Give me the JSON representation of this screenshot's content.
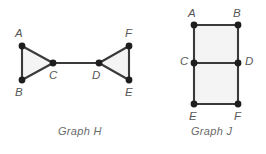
{
  "figure": {
    "width": 266,
    "height": 154,
    "background_color": "#ffffff",
    "edge_color": "#3a3a3a",
    "vertex_color": "#1e1e1e",
    "face_fill_color": "#f4f4f4",
    "label_color": "#585858",
    "caption_color": "#6a6a6a"
  },
  "graphs": [
    {
      "id": "graph-h",
      "caption": "Graph H",
      "caption_x": 58,
      "caption_y": 126,
      "vertices": [
        {
          "id": "A",
          "label": "A",
          "x": 22,
          "y": 46,
          "label_x": 15,
          "label_y": 28
        },
        {
          "id": "B",
          "label": "B",
          "x": 22,
          "y": 80,
          "label_x": 15,
          "label_y": 87
        },
        {
          "id": "C",
          "label": "C",
          "x": 53,
          "y": 63,
          "label_x": 49,
          "label_y": 70
        },
        {
          "id": "D",
          "label": "D",
          "x": 99,
          "y": 63,
          "label_x": 92,
          "label_y": 70
        },
        {
          "id": "E",
          "label": "E",
          "x": 129,
          "y": 80,
          "label_x": 125,
          "label_y": 87
        },
        {
          "id": "F",
          "label": "F",
          "x": 129,
          "y": 46,
          "label_x": 125,
          "label_y": 28
        }
      ],
      "faces": [
        {
          "id": "face-abc",
          "points": "22,46 22,80 53,63"
        },
        {
          "id": "face-def",
          "points": "99,63 129,46 129,80"
        }
      ],
      "edges": [
        {
          "id": "edge-A-B",
          "from": "A",
          "to": "B",
          "x1": 22,
          "y1": 46,
          "x2": 22,
          "y2": 80
        },
        {
          "id": "edge-A-C",
          "from": "A",
          "to": "C",
          "x1": 22,
          "y1": 46,
          "x2": 53,
          "y2": 63
        },
        {
          "id": "edge-B-C",
          "from": "B",
          "to": "C",
          "x1": 22,
          "y1": 80,
          "x2": 53,
          "y2": 63
        },
        {
          "id": "edge-C-D",
          "from": "C",
          "to": "D",
          "x1": 53,
          "y1": 63,
          "x2": 99,
          "y2": 63
        },
        {
          "id": "edge-D-F",
          "from": "D",
          "to": "F",
          "x1": 99,
          "y1": 63,
          "x2": 129,
          "y2": 46
        },
        {
          "id": "edge-D-E",
          "from": "D",
          "to": "E",
          "x1": 99,
          "y1": 63,
          "x2": 129,
          "y2": 80
        },
        {
          "id": "edge-E-F",
          "from": "E",
          "to": "F",
          "x1": 129,
          "y1": 80,
          "x2": 129,
          "y2": 46
        }
      ]
    },
    {
      "id": "graph-j",
      "caption": "Graph J",
      "caption_x": 191,
      "caption_y": 126,
      "vertices": [
        {
          "id": "A",
          "label": "A",
          "x": 194,
          "y": 25,
          "label_x": 188,
          "label_y": 8
        },
        {
          "id": "B",
          "label": "B",
          "x": 238,
          "y": 25,
          "label_x": 233,
          "label_y": 8
        },
        {
          "id": "C",
          "label": "C",
          "x": 194,
          "y": 63,
          "label_x": 180,
          "label_y": 56
        },
        {
          "id": "D",
          "label": "D",
          "x": 238,
          "y": 63,
          "label_x": 245,
          "label_y": 56
        },
        {
          "id": "E",
          "label": "E",
          "x": 194,
          "y": 104,
          "label_x": 189,
          "label_y": 111
        },
        {
          "id": "F",
          "label": "F",
          "x": 238,
          "y": 104,
          "label_x": 234,
          "label_y": 111
        }
      ],
      "faces": [
        {
          "id": "face-abdc",
          "points": "194,25 238,25 238,63 194,63"
        },
        {
          "id": "face-cdfe",
          "points": "194,63 238,63 238,104 194,104"
        }
      ],
      "edges": [
        {
          "id": "edge-A-B",
          "from": "A",
          "to": "B",
          "x1": 194,
          "y1": 25,
          "x2": 238,
          "y2": 25
        },
        {
          "id": "edge-A-C",
          "from": "A",
          "to": "C",
          "x1": 194,
          "y1": 25,
          "x2": 194,
          "y2": 63
        },
        {
          "id": "edge-B-D",
          "from": "B",
          "to": "D",
          "x1": 238,
          "y1": 25,
          "x2": 238,
          "y2": 63
        },
        {
          "id": "edge-C-D",
          "from": "C",
          "to": "D",
          "x1": 194,
          "y1": 63,
          "x2": 238,
          "y2": 63
        },
        {
          "id": "edge-C-E",
          "from": "C",
          "to": "E",
          "x1": 194,
          "y1": 63,
          "x2": 194,
          "y2": 104
        },
        {
          "id": "edge-D-F",
          "from": "D",
          "to": "F",
          "x1": 238,
          "y1": 63,
          "x2": 238,
          "y2": 104
        },
        {
          "id": "edge-E-F",
          "from": "E",
          "to": "F",
          "x1": 194,
          "y1": 104,
          "x2": 238,
          "y2": 104
        }
      ]
    }
  ]
}
